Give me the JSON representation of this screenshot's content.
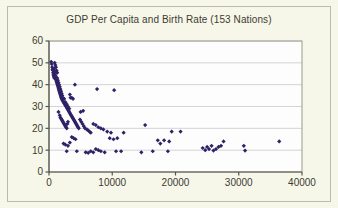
{
  "chart_data": {
    "type": "scatter",
    "title": "GDP Per Capita and Birth Rate (153 Nations)",
    "xlabel": "",
    "ylabel": "",
    "xlim": [
      0,
      40000
    ],
    "ylim": [
      0,
      60
    ],
    "xticks": [
      0,
      10000,
      20000,
      30000,
      40000
    ],
    "yticks": [
      0,
      10,
      20,
      30,
      40,
      50,
      60
    ],
    "xtick_labels": [
      "0",
      "10000",
      "20000",
      "30000",
      "40000"
    ],
    "ytick_labels": [
      "0",
      "10",
      "20",
      "30",
      "40",
      "50",
      "60"
    ],
    "grid": "horizontal",
    "legend": "none",
    "marker": "diamond",
    "marker_color": "#2e2166",
    "n_points": 153,
    "series": [
      {
        "name": "Nations",
        "points": [
          [
            350,
            50.5
          ],
          [
            420,
            49.5
          ],
          [
            500,
            48.0
          ],
          [
            560,
            47.0
          ],
          [
            610,
            46.5
          ],
          [
            650,
            45.5
          ],
          [
            700,
            44.5
          ],
          [
            760,
            44.0
          ],
          [
            800,
            43.5
          ],
          [
            850,
            43.0
          ],
          [
            900,
            47.5
          ],
          [
            950,
            46.0
          ],
          [
            1000,
            45.0
          ],
          [
            1050,
            44.0
          ],
          [
            1100,
            42.5
          ],
          [
            1150,
            42.0
          ],
          [
            1200,
            41.5
          ],
          [
            1250,
            41.0
          ],
          [
            1300,
            40.5
          ],
          [
            1350,
            40.0
          ],
          [
            900,
            50.0
          ],
          [
            1000,
            49.0
          ],
          [
            1100,
            48.0
          ],
          [
            1200,
            46.5
          ],
          [
            1300,
            45.5
          ],
          [
            1400,
            39.5
          ],
          [
            1450,
            39.0
          ],
          [
            1500,
            38.5
          ],
          [
            1550,
            38.0
          ],
          [
            1600,
            37.5
          ],
          [
            1650,
            37.0
          ],
          [
            1700,
            36.5
          ],
          [
            1750,
            36.0
          ],
          [
            1800,
            35.5
          ],
          [
            1850,
            35.0
          ],
          [
            1300,
            43.0
          ],
          [
            1400,
            42.0
          ],
          [
            1500,
            41.0
          ],
          [
            1600,
            40.0
          ],
          [
            1700,
            39.0
          ],
          [
            1900,
            34.5
          ],
          [
            1950,
            34.0
          ],
          [
            2000,
            33.5
          ],
          [
            2100,
            33.0
          ],
          [
            2200,
            32.5
          ],
          [
            2300,
            32.0
          ],
          [
            2400,
            31.5
          ],
          [
            2500,
            31.0
          ],
          [
            2600,
            30.5
          ],
          [
            2700,
            30.0
          ],
          [
            1800,
            38.0
          ],
          [
            1900,
            37.0
          ],
          [
            2000,
            36.0
          ],
          [
            2100,
            35.0
          ],
          [
            2200,
            34.0
          ],
          [
            2800,
            29.5
          ],
          [
            2900,
            29.0
          ],
          [
            3000,
            28.5
          ],
          [
            3100,
            28.0
          ],
          [
            3200,
            27.5
          ],
          [
            3300,
            27.0
          ],
          [
            3400,
            26.5
          ],
          [
            3500,
            26.0
          ],
          [
            3600,
            25.5
          ],
          [
            3700,
            25.0
          ],
          [
            2400,
            33.5
          ],
          [
            2600,
            32.0
          ],
          [
            2800,
            31.0
          ],
          [
            3000,
            30.0
          ],
          [
            3200,
            29.0
          ],
          [
            1500,
            27.5
          ],
          [
            1700,
            26.0
          ],
          [
            1800,
            25.0
          ],
          [
            1900,
            24.5
          ],
          [
            2000,
            24.0
          ],
          [
            2100,
            23.5
          ],
          [
            2200,
            23.0
          ],
          [
            2300,
            22.5
          ],
          [
            2400,
            22.0
          ],
          [
            2500,
            21.5
          ],
          [
            2600,
            21.0
          ],
          [
            2700,
            20.5
          ],
          [
            2800,
            20.0
          ],
          [
            2900,
            22.0
          ],
          [
            3000,
            23.0
          ],
          [
            3800,
            24.5
          ],
          [
            3900,
            24.0
          ],
          [
            4000,
            23.5
          ],
          [
            4100,
            23.0
          ],
          [
            4200,
            22.5
          ],
          [
            4300,
            22.0
          ],
          [
            4400,
            21.5
          ],
          [
            4500,
            21.0
          ],
          [
            4600,
            20.5
          ],
          [
            4700,
            20.0
          ],
          [
            3400,
            34.0
          ],
          [
            3600,
            34.0
          ],
          [
            3800,
            33.5
          ],
          [
            4100,
            40.0
          ],
          [
            3300,
            35.5
          ],
          [
            4900,
            24.0
          ],
          [
            5100,
            23.0
          ],
          [
            5300,
            22.0
          ],
          [
            5500,
            21.0
          ],
          [
            5700,
            20.0
          ],
          [
            6000,
            19.5
          ],
          [
            6200,
            19.0
          ],
          [
            6400,
            18.5
          ],
          [
            6600,
            18.0
          ],
          [
            5000,
            27.5
          ],
          [
            5400,
            28.0
          ],
          [
            7600,
            38.0
          ],
          [
            10300,
            37.5
          ],
          [
            7000,
            22.0
          ],
          [
            7400,
            21.5
          ],
          [
            7800,
            20.5
          ],
          [
            8200,
            20.0
          ],
          [
            8600,
            19.5
          ],
          [
            9200,
            18.5
          ],
          [
            9800,
            18.0
          ],
          [
            2300,
            13.0
          ],
          [
            2600,
            12.5
          ],
          [
            3000,
            12.0
          ],
          [
            3300,
            13.5
          ],
          [
            3600,
            16.0
          ],
          [
            3900,
            15.5
          ],
          [
            4200,
            15.0
          ],
          [
            2800,
            9.5
          ],
          [
            4400,
            9.5
          ],
          [
            5800,
            9.0
          ],
          [
            6200,
            8.8
          ],
          [
            6600,
            9.5
          ],
          [
            7000,
            9.0
          ],
          [
            7400,
            10.5
          ],
          [
            7800,
            10.0
          ],
          [
            8200,
            9.5
          ],
          [
            8800,
            9.0
          ],
          [
            9600,
            15.5
          ],
          [
            10200,
            15.0
          ],
          [
            10800,
            15.5
          ],
          [
            10600,
            9.5
          ],
          [
            11400,
            9.5
          ],
          [
            11800,
            18.0
          ],
          [
            14600,
            9.0
          ],
          [
            15200,
            21.5
          ],
          [
            16400,
            9.5
          ],
          [
            17200,
            14.5
          ],
          [
            17600,
            13.0
          ],
          [
            18200,
            14.5
          ],
          [
            18800,
            9.5
          ],
          [
            19400,
            18.5
          ],
          [
            20800,
            18.5
          ],
          [
            19000,
            14.0
          ],
          [
            24300,
            11.0
          ],
          [
            24700,
            10.0
          ],
          [
            25000,
            11.5
          ],
          [
            25300,
            10.5
          ],
          [
            25700,
            12.0
          ],
          [
            26000,
            9.8
          ],
          [
            26400,
            10.5
          ],
          [
            26800,
            11.5
          ],
          [
            27200,
            12.0
          ],
          [
            27600,
            14.0
          ],
          [
            30800,
            12.0
          ],
          [
            31000,
            9.8
          ],
          [
            36400,
            14.0
          ]
        ]
      }
    ]
  },
  "axes": {
    "x_title": "",
    "y_title": ""
  }
}
